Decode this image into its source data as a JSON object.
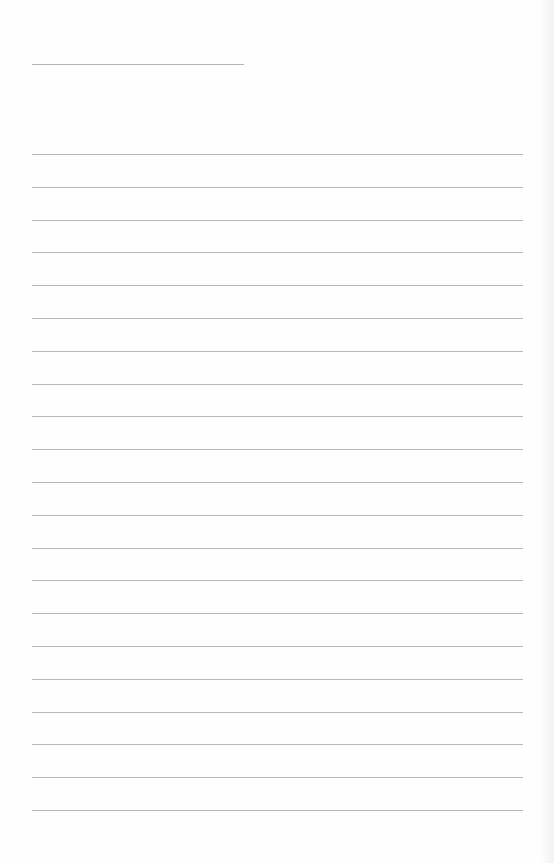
{
  "document": {
    "type": "lined-paper",
    "header_line": {
      "left": 32,
      "top": 64,
      "width": 212
    },
    "rules": {
      "count": 21,
      "left": 32,
      "width": 491,
      "first_top": 154,
      "spacing": 32.8
    },
    "colors": {
      "paper": "#fefefe",
      "line": "#b8b8b8"
    }
  }
}
